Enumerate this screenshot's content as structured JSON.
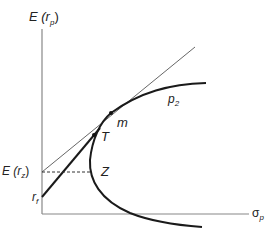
{
  "diagram": {
    "y_axis_label": "E (r",
    "y_axis_sub": "p",
    "y_axis_close": ")",
    "x_axis_label": "σ",
    "x_axis_sub": "p",
    "point_labels": {
      "m": "m",
      "T": "T",
      "Z": "Z",
      "curve": "p",
      "curve_sub": "2"
    },
    "y_ticks": {
      "erz": "E (r",
      "erz_sub": "z",
      "erz_close": ")",
      "rf": "r",
      "rf_sub": "f"
    },
    "colors": {
      "line": "#1a1a1a",
      "thin": "#555555",
      "axis": "#888888"
    }
  }
}
